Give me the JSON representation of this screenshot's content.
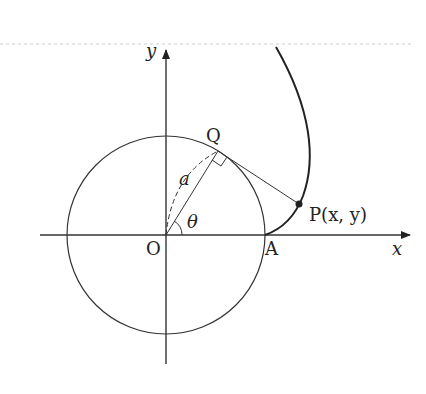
{
  "diagram": {
    "labels": {
      "y_axis": "y",
      "x_axis": "x",
      "origin": "O",
      "point_a": "A",
      "point_q": "Q",
      "point_p": "P(x, y)",
      "radius": "a",
      "angle": "θ"
    },
    "geometry": {
      "origin": [
        166,
        235
      ],
      "radius": 99,
      "theta_deg": 58,
      "colors": {
        "line": "#333333",
        "curve": "#222222",
        "dash_top": "#cccccc"
      }
    }
  }
}
